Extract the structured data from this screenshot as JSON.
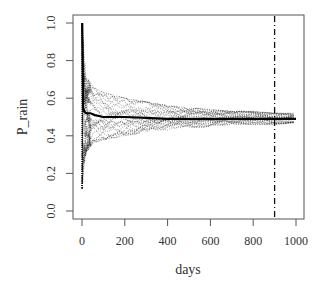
{
  "chart_data": {
    "type": "line",
    "title": "",
    "xlabel": "days",
    "ylabel": "P_rain",
    "xlim": [
      0,
      1000
    ],
    "ylim": [
      0.0,
      1.0
    ],
    "x_ticks": [
      0,
      200,
      400,
      600,
      800,
      1000
    ],
    "x_tick_labels": [
      "0",
      "200",
      "400",
      "600",
      "800",
      "1000"
    ],
    "y_ticks": [
      0.0,
      0.2,
      0.4,
      0.6,
      0.8,
      1.0
    ],
    "y_tick_labels": [
      "0.0",
      "0.2",
      "0.4",
      "0.6",
      "0.8",
      "1.0"
    ],
    "grid": false,
    "legend": "none",
    "annotations": [
      {
        "type": "vertical-dashdot-line",
        "x": 900
      }
    ],
    "series": [
      {
        "name": "mean",
        "style": "solid-thick",
        "x": [
          1,
          5,
          10,
          20,
          40,
          60,
          100,
          150,
          200,
          300,
          400,
          500,
          600,
          700,
          800,
          900,
          1000
        ],
        "values": [
          1.0,
          0.55,
          0.53,
          0.52,
          0.52,
          0.51,
          0.5,
          0.5,
          0.5,
          0.495,
          0.49,
          0.49,
          0.49,
          0.49,
          0.49,
          0.49,
          0.49
        ]
      },
      {
        "name": "envelope-upper",
        "style": "dotted",
        "x": [
          1,
          10,
          20,
          50,
          100,
          200,
          300,
          400,
          500,
          600,
          700,
          800,
          900,
          1000
        ],
        "values": [
          1.0,
          0.85,
          0.72,
          0.66,
          0.63,
          0.6,
          0.58,
          0.56,
          0.55,
          0.54,
          0.53,
          0.53,
          0.52,
          0.52
        ]
      },
      {
        "name": "envelope-lower",
        "style": "dotted",
        "x": [
          1,
          10,
          20,
          50,
          100,
          200,
          300,
          400,
          500,
          600,
          700,
          800,
          900,
          1000
        ],
        "values": [
          0.12,
          0.25,
          0.31,
          0.36,
          0.38,
          0.4,
          0.42,
          0.43,
          0.44,
          0.45,
          0.46,
          0.46,
          0.46,
          0.47
        ]
      }
    ],
    "n_simulation_traces": "many (dotted)"
  }
}
